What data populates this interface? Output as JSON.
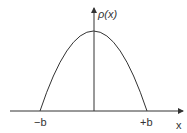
{
  "diagram": {
    "type": "function-plot",
    "y_axis_label": "ρ(x)",
    "x_axis_label": "x",
    "left_root_label": "−b",
    "right_root_label": "+b",
    "colors": {
      "stroke": "#333333",
      "background": "#ffffff"
    }
  }
}
